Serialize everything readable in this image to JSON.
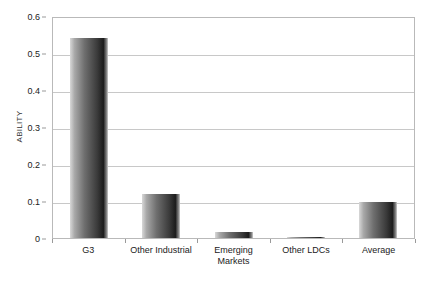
{
  "chart_data": {
    "type": "bar",
    "title": "",
    "xlabel": "",
    "ylabel": "ABILITY",
    "categories": [
      "G3",
      "Other Industrial",
      "Emerging Markets",
      "Other LDCs",
      "Average"
    ],
    "category_lines": [
      [
        "G3"
      ],
      [
        "Other Industrial"
      ],
      [
        "Emerging",
        "Markets"
      ],
      [
        "Other LDCs"
      ],
      [
        "Average"
      ]
    ],
    "values": [
      0.54,
      0.12,
      0.015,
      0.003,
      0.098
    ],
    "ylim": [
      0,
      0.6
    ],
    "ytick_labels": [
      "0.6",
      "0.5",
      "0.4",
      "0.3",
      "0.2",
      "0.1",
      "0"
    ],
    "ytick_values": [
      0.6,
      0.5,
      0.4,
      0.3,
      0.2,
      0.1,
      0
    ],
    "grid": "horizontal",
    "legend": "none",
    "bar_color": "#3a3a3a",
    "grid_color": "#c8c8c8",
    "frame_color": "#b9b9b9",
    "background_color": "#ffffff"
  }
}
